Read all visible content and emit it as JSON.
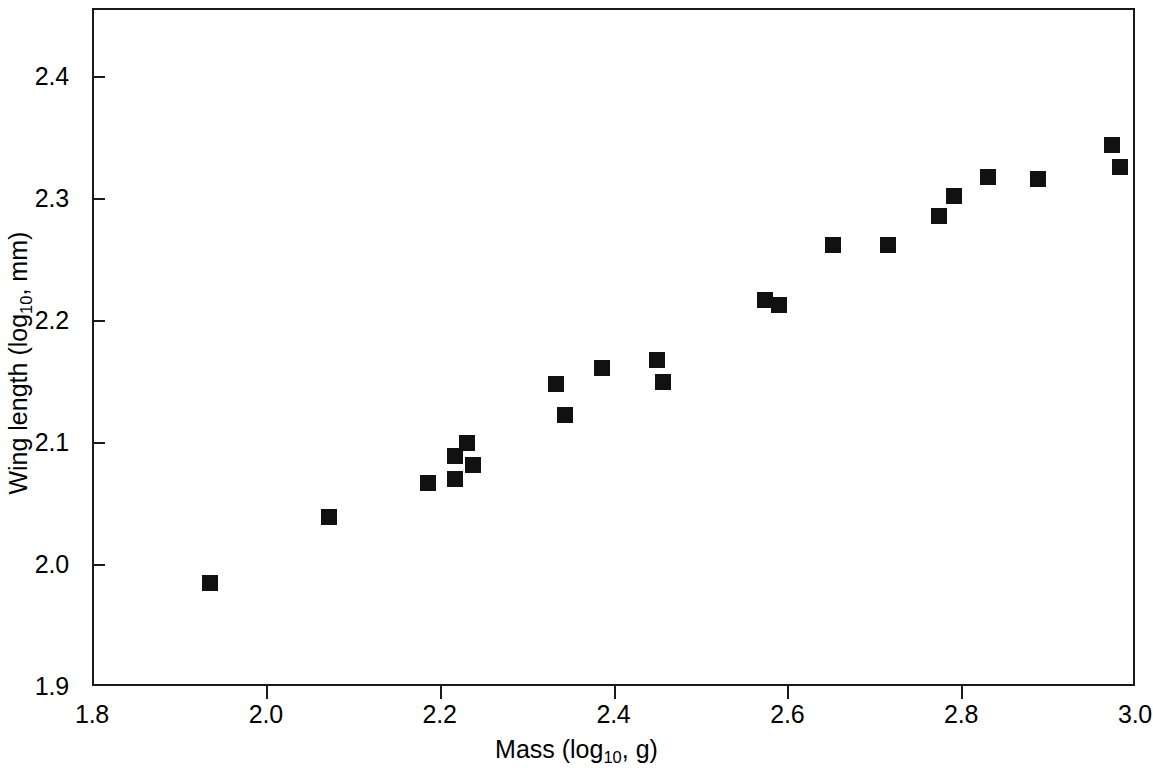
{
  "chart_data": {
    "type": "scatter",
    "title": "",
    "xlabel": "Mass (log10, g)",
    "ylabel": "Wing length (log10, mm)",
    "xlabel_prefix": "Mass (log",
    "xlabel_sub": "10",
    "xlabel_suffix": ", g)",
    "ylabel_prefix": "Wing length (log",
    "ylabel_sub": "10",
    "ylabel_suffix": ", mm)",
    "xlim": [
      1.8,
      3.0
    ],
    "ylim": [
      1.9,
      2.4558
    ],
    "x_ticks": [
      1.8,
      2.0,
      2.2,
      2.4,
      2.6,
      2.8,
      3.0
    ],
    "x_tick_labels": [
      "1.8",
      "2.0",
      "2.2",
      "2.4",
      "2.6",
      "2.8",
      "3.0"
    ],
    "y_ticks": [
      1.9,
      2.0,
      2.1,
      2.2,
      2.3,
      2.4
    ],
    "y_tick_labels": [
      "1.9",
      "2.0",
      "2.1",
      "2.2",
      "2.3",
      "2.4"
    ],
    "grid": false,
    "legend": null,
    "marker": {
      "shape": "square",
      "color": "#111111",
      "size_px": 16
    },
    "series": [
      {
        "name": "observations",
        "color": "#111111",
        "points": [
          {
            "x": 1.933,
            "y": 1.986
          },
          {
            "x": 2.07,
            "y": 2.04
          },
          {
            "x": 2.184,
            "y": 2.068
          },
          {
            "x": 2.215,
            "y": 2.071
          },
          {
            "x": 2.215,
            "y": 2.09
          },
          {
            "x": 2.229,
            "y": 2.101
          },
          {
            "x": 2.236,
            "y": 2.083
          },
          {
            "x": 2.332,
            "y": 2.149
          },
          {
            "x": 2.342,
            "y": 2.124
          },
          {
            "x": 2.384,
            "y": 2.162
          },
          {
            "x": 2.448,
            "y": 2.169
          },
          {
            "x": 2.455,
            "y": 2.151
          },
          {
            "x": 2.572,
            "y": 2.218
          },
          {
            "x": 2.588,
            "y": 2.214
          },
          {
            "x": 2.65,
            "y": 2.263
          },
          {
            "x": 2.713,
            "y": 2.263
          },
          {
            "x": 2.772,
            "y": 2.287
          },
          {
            "x": 2.789,
            "y": 2.303
          },
          {
            "x": 2.829,
            "y": 2.319
          },
          {
            "x": 2.886,
            "y": 2.317
          },
          {
            "x": 2.971,
            "y": 2.345
          },
          {
            "x": 2.981,
            "y": 2.327
          }
        ]
      }
    ]
  }
}
